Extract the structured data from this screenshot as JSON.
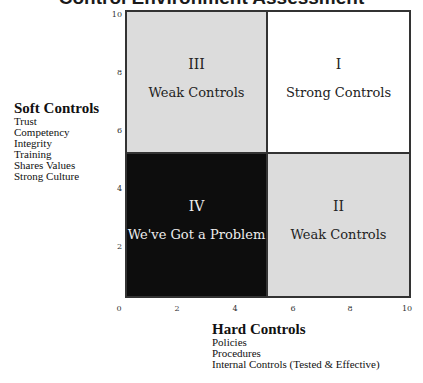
{
  "title": "Control Environment Assessment",
  "y_axis": {
    "heading": "Soft Controls",
    "items": [
      "Trust",
      "Competency",
      "Integrity",
      "Training",
      "Shares Values",
      "Strong Culture"
    ],
    "ticks": [
      "10",
      "8",
      "6",
      "4",
      "2"
    ]
  },
  "x_axis": {
    "heading": "Hard Controls",
    "items": [
      "Policies",
      "Procedures",
      "Internal Controls (Tested & Effective)"
    ],
    "ticks": [
      "0",
      "2",
      "4",
      "6",
      "8",
      "10"
    ]
  },
  "quadrants": {
    "q1": {
      "numeral": "I",
      "label": "Strong Controls",
      "color": "#ffffff"
    },
    "q2": {
      "numeral": "II",
      "label": "Weak Controls",
      "color": "#dcdcdc"
    },
    "q3": {
      "numeral": "III",
      "label": "Weak Controls",
      "color": "#dcdcdc"
    },
    "q4": {
      "numeral": "IV",
      "label": "We've Got a Problem",
      "color": "#0d0d0d"
    }
  }
}
